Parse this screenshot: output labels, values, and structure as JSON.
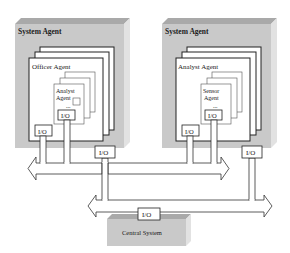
{
  "diagram": {
    "left_system": {
      "title": "System Agent",
      "outer_agent": "Officer Agent",
      "inner_agent_line1": "Analyst",
      "inner_agent_line2": "Agent",
      "ellipsis": "...",
      "inner_io": "I/O",
      "outer_io": "I/O"
    },
    "right_system": {
      "title": "System Agent",
      "outer_agent": "Analyst Agent",
      "inner_agent_line1": "Sensor",
      "inner_agent_line2": "Agent",
      "ellipsis": "...",
      "inner_io": "I/O",
      "outer_io": "I/O"
    },
    "middle_io": "I/O",
    "right_io": "I/O",
    "central": {
      "title": "Central System",
      "io": "I/O"
    },
    "colors": {
      "block_face": "#c8c8c8",
      "block_top": "#a8a8a8",
      "block_side": "#e0e0e0",
      "line": "#2a2a2a",
      "panel": "#ffffff"
    }
  }
}
